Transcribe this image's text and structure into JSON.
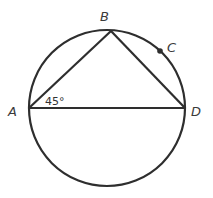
{
  "diagram": {
    "type": "circle-geometry",
    "points": {
      "A": {
        "label": "A",
        "x": 29,
        "y": 108
      },
      "B": {
        "label": "B",
        "x": 111,
        "y": 31
      },
      "C": {
        "label": "C",
        "x": 160,
        "y": 51
      },
      "D": {
        "label": "D",
        "x": 185,
        "y": 108
      }
    },
    "angle_label": "45°",
    "colors": {
      "stroke": "#2e2e2e",
      "text": "#3a3a3a",
      "background": "#ffffff"
    }
  }
}
